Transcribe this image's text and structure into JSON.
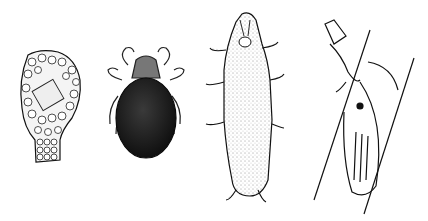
{
  "figure": {
    "background": "#ffffff",
    "ink": "#111111",
    "panels": [
      {
        "id": "testate-amoeba",
        "description": "agglutinated test covered with mineral grains"
      },
      {
        "id": "mite",
        "description": "dark-bodied mite with eight legs"
      },
      {
        "id": "tardigrade",
        "description": "stippled water bear with four pairs of clawed legs"
      },
      {
        "id": "rotifer",
        "description": "line drawing of bdelloid rotifer on a plant fragment"
      }
    ]
  }
}
